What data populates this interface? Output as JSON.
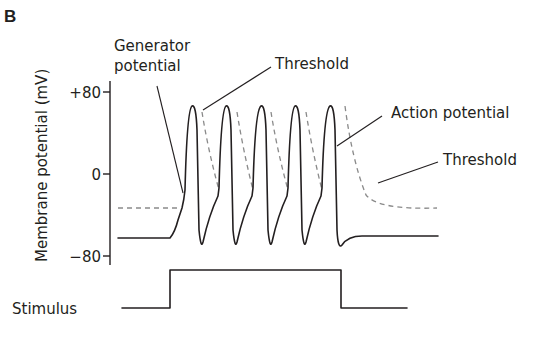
{
  "panel_label": "B",
  "y_axis": {
    "label": "Membrane potential (mV)",
    "ticks": [
      "+80",
      "0",
      "−80"
    ],
    "tick_values": [
      80,
      0,
      -80
    ]
  },
  "annotations": {
    "generator_line1": "Generator",
    "generator_line2": "potential",
    "threshold_top": "Threshold",
    "action_potential": "Action potential",
    "threshold_right": "Threshold"
  },
  "stimulus_label": "Stimulus",
  "colors": {
    "trace": "#231f20",
    "threshold_dashed": "#8a8a8a"
  },
  "description": {
    "spike_count": 5,
    "resting_potential_mV": -65,
    "initial_threshold_mV": -45,
    "spike_peak_mV": 65
  }
}
